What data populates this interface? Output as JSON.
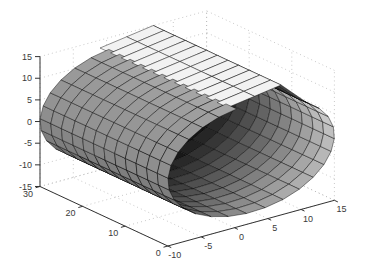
{
  "figure": {
    "background": "#ffffff"
  },
  "chart_data": {
    "type": "3d-surface",
    "title": "",
    "xlabel": "",
    "ylabel": "",
    "zlabel": "",
    "axes": {
      "x": {
        "range": [
          -10,
          15
        ],
        "ticks": [
          -10,
          -5,
          0,
          5,
          10,
          15
        ]
      },
      "y": {
        "range": [
          0,
          30
        ],
        "ticks": [
          0,
          10,
          20,
          30
        ]
      },
      "z": {
        "range": [
          -15,
          15
        ],
        "ticks": [
          -15,
          -10,
          -5,
          0,
          5,
          10,
          15
        ]
      }
    },
    "view": {
      "azimuth": -37.5,
      "elevation": 30,
      "projection": "orthographic"
    },
    "grid": {
      "visible": true,
      "style": "dotted",
      "color": "#b4b4b4"
    },
    "axis_color": "#333333",
    "label_color": "#3a3a3a",
    "surface": {
      "kind": "profile extruded along y",
      "y_extent": [
        0,
        30
      ],
      "y_segments": 12,
      "profile": {
        "circle": {
          "center": [
            2.5,
            0
          ],
          "radius": 12.5,
          "arc_start_deg": 48,
          "arc_sweep_deg": -308,
          "arc_segments": 24
        },
        "strip": [
          [
            -1,
            13.2
          ],
          [
            3,
            14.1
          ],
          [
            7,
            15
          ]
        ],
        "note": "strip joins circle rim at arc start via one bend segment; opposite strip edge hangs free over slot"
      },
      "mesh_line_color": "#000000",
      "shading": {
        "outer_gray_by_angle": [
          [
            41.5,
            0.97
          ],
          [
            60,
            0.9
          ],
          [
            75,
            0.8
          ],
          [
            100,
            0.66
          ],
          [
            130,
            0.6
          ],
          [
            165,
            0.57
          ],
          [
            195,
            0.5
          ],
          [
            210,
            0.43
          ],
          [
            221.5,
            0.32
          ]
        ],
        "inner_gray_by_angle": [
          [
            221.5,
            0.3
          ],
          [
            240,
            0.46
          ],
          [
            270,
            0.61
          ],
          [
            300,
            0.69
          ],
          [
            330,
            0.73
          ],
          [
            360,
            0.77
          ],
          [
            385,
            0.82
          ],
          [
            401.5,
            0.9
          ]
        ],
        "strip_outer_gray": 0.95,
        "bend_outer_gray": 0.86,
        "strip_inner_gray": 0.2,
        "bend_inner_gray": 0.3,
        "inner_depth_fade": 0.72
      }
    },
    "tick_font_px": 9
  }
}
